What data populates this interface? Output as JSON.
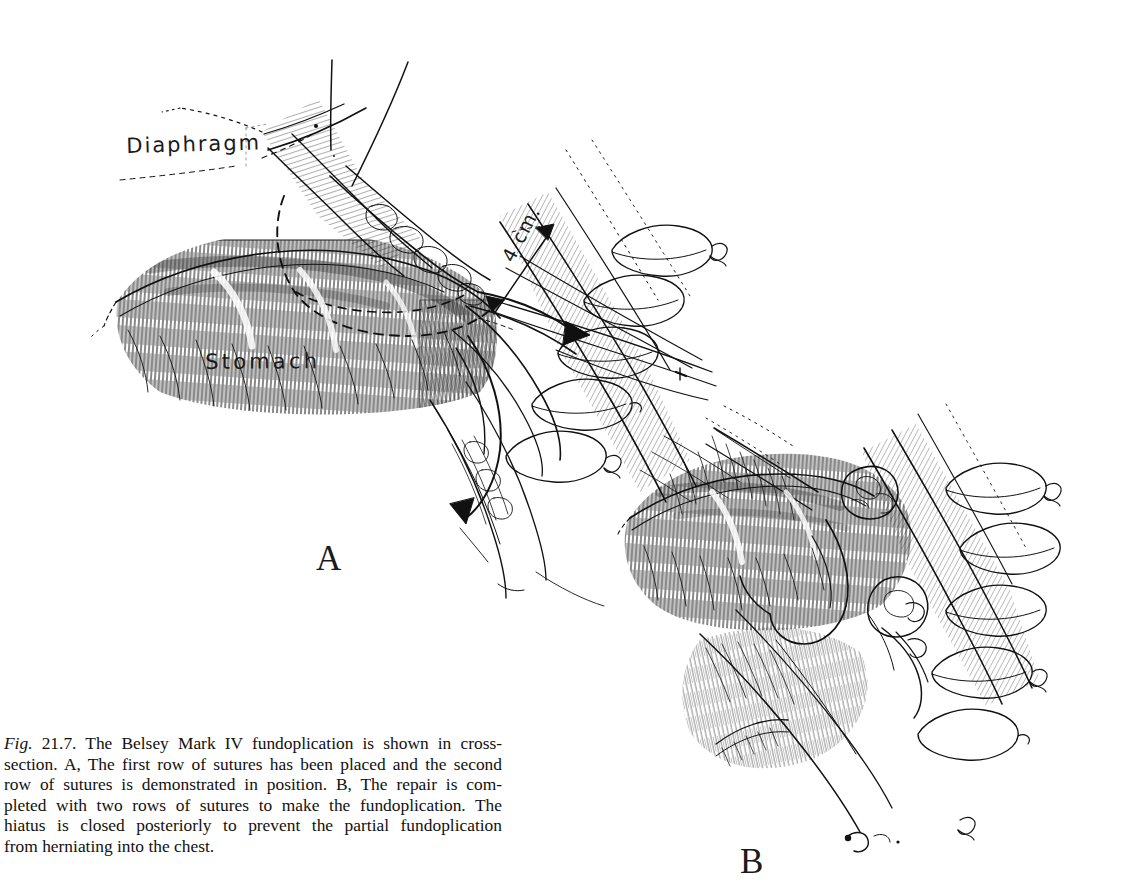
{
  "figure": {
    "background_color": "#ffffff",
    "ink_color": "#111111",
    "media": "pen-and-ink line drawing",
    "panels": [
      {
        "letter": "A",
        "description": "The first row of sutures has been placed and the second row of sutures is demonstrated in position."
      },
      {
        "letter": "B",
        "description": "The repair is completed with two rows of sutures to make the fundoplication. The hiatus is closed posteriorly to prevent the partial fundoplication from herniating into the chest."
      }
    ]
  },
  "labels": {
    "diaphragm": "Diaphragm",
    "stomach": "Stomach",
    "measurement": "4 cm."
  },
  "panel_letters": {
    "a": "A",
    "b": "B"
  },
  "caption": {
    "fig_word": "Fig.",
    "number": "21.7.",
    "lines": [
      "The Belsey Mark IV fundoplication is shown in cross-",
      "section. A, The first row of sutures has been placed and the second",
      "row of sutures is demonstrated in position. B, The repair is com-",
      "pleted with two rows of sutures to make the fundoplication. The",
      "hiatus is closed posteriorly to prevent the partial fundoplication",
      "from herniating into the chest."
    ],
    "full_text": "Fig. 21.7. The Belsey Mark IV fundoplication is shown in cross-section. A, The first row of sutures has been placed and the second row of sutures is demonstrated in position. B, The repair is completed with two rows of sutures to make the fundoplication. The hiatus is closed posteriorly to prevent the partial fundoplication from herniating into the chest."
  }
}
